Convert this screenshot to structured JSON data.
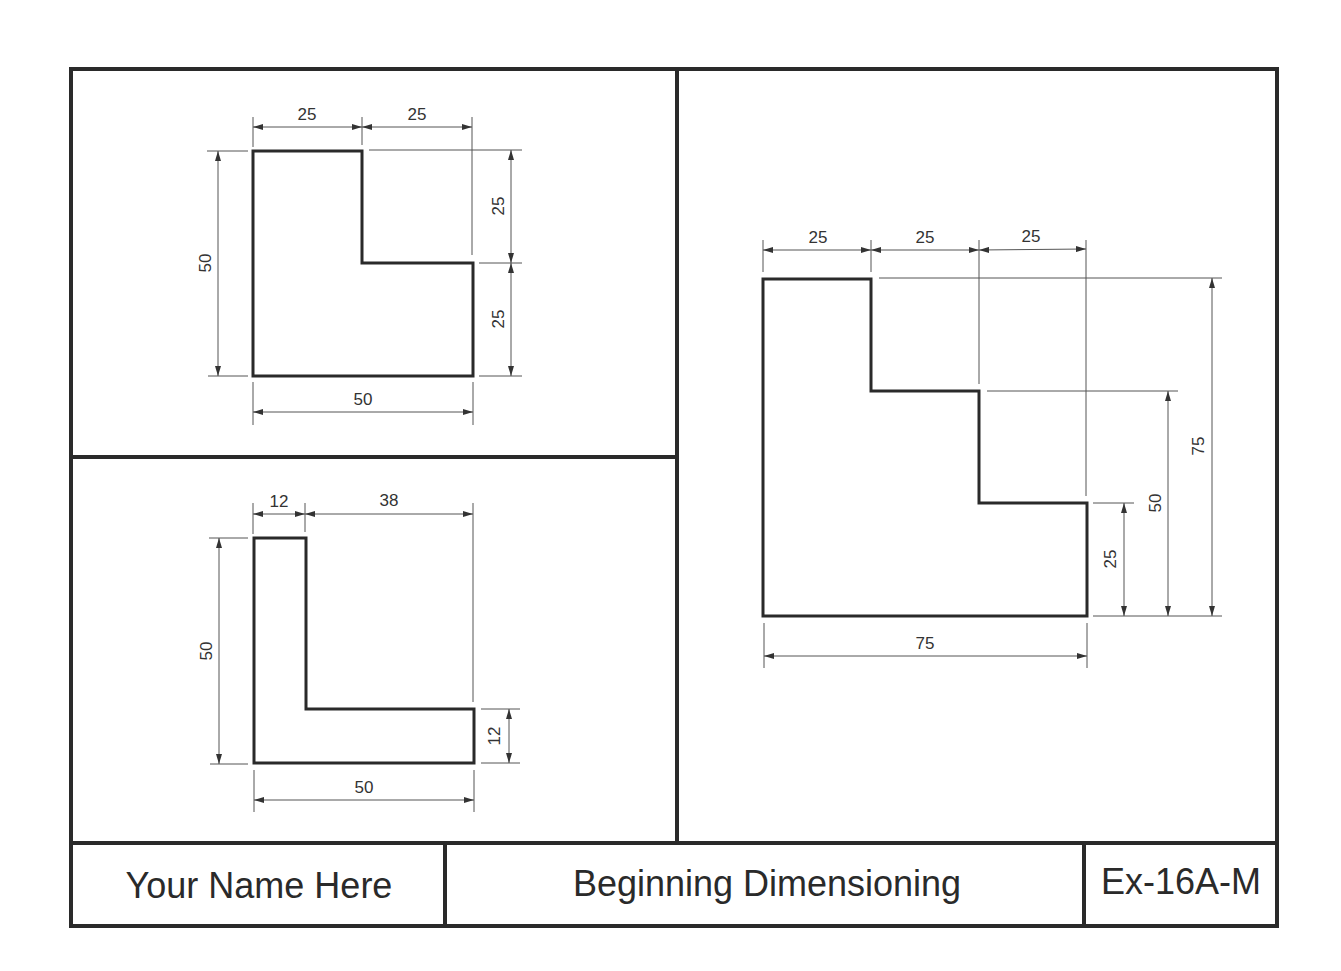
{
  "title_block": {
    "name": "Your Name Here",
    "title": "Beginning Dimensioning",
    "number": "Ex-16A-M"
  },
  "views": {
    "top_left": {
      "shape": "L-shape (notched rectangle)",
      "dims": {
        "top_left_width": "25",
        "top_right_width": "25",
        "overall_height": "50",
        "right_upper_height": "25",
        "right_lower_height": "25",
        "overall_width": "50"
      }
    },
    "bottom_left": {
      "shape": "L-angle",
      "dims": {
        "leg_width": "12",
        "remaining_width": "38",
        "overall_height": "50",
        "flange_height": "12",
        "overall_width": "50"
      }
    },
    "right": {
      "shape": "Stepped profile",
      "dims": {
        "step1_width": "25",
        "step2_width": "25",
        "step3_width": "25",
        "height_25": "25",
        "height_50": "50",
        "height_75": "75",
        "overall_width": "75"
      }
    }
  },
  "colors": {
    "line": "#2a2a2a",
    "background": "#ffffff"
  }
}
